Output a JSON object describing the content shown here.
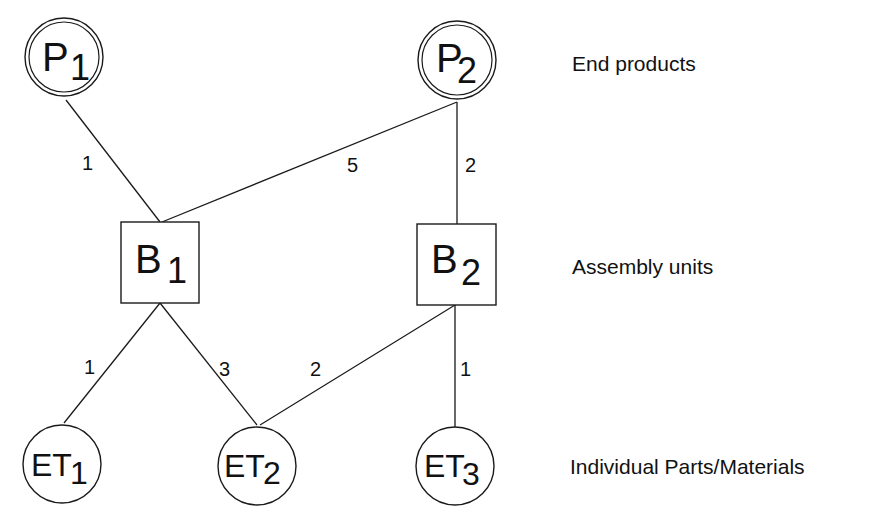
{
  "diagram": {
    "title": "",
    "type": "bill-of-materials-graph",
    "levels": [
      {
        "id": "end",
        "label": "End products"
      },
      {
        "id": "assembly",
        "label": "Assembly units"
      },
      {
        "id": "parts",
        "label": "Individual Parts/Materials"
      }
    ],
    "nodes": [
      {
        "id": "P1",
        "main": "P",
        "sub": "1",
        "level": "end",
        "shape": "double-circle"
      },
      {
        "id": "P2",
        "main": "P",
        "sub": "2",
        "level": "end",
        "shape": "double-circle"
      },
      {
        "id": "B1",
        "main": "B",
        "sub": "1",
        "level": "assembly",
        "shape": "square"
      },
      {
        "id": "B2",
        "main": "B",
        "sub": "2",
        "level": "assembly",
        "shape": "square"
      },
      {
        "id": "ET1",
        "main": "ET",
        "sub": "1",
        "level": "parts",
        "shape": "circle"
      },
      {
        "id": "ET2",
        "main": "ET",
        "sub": "2",
        "level": "parts",
        "shape": "circle"
      },
      {
        "id": "ET3",
        "main": "ET",
        "sub": "3",
        "level": "parts",
        "shape": "circle"
      }
    ],
    "edges": [
      {
        "from": "P1",
        "to": "B1",
        "quantity": "1"
      },
      {
        "from": "P2",
        "to": "B1",
        "quantity": "5"
      },
      {
        "from": "P2",
        "to": "B2",
        "quantity": "2"
      },
      {
        "from": "B1",
        "to": "ET1",
        "quantity": "1"
      },
      {
        "from": "B1",
        "to": "ET2",
        "quantity": "3"
      },
      {
        "from": "B2",
        "to": "ET2",
        "quantity": "2"
      },
      {
        "from": "B2",
        "to": "ET3",
        "quantity": "1"
      }
    ]
  }
}
